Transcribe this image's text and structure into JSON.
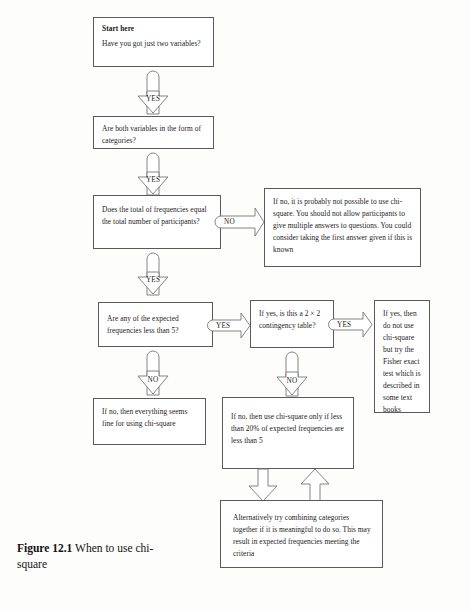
{
  "figure": {
    "label": "Figure 12.1",
    "title": "When to use chi-square"
  },
  "flowchart": {
    "type": "decision-flowchart",
    "nodes": [
      {
        "id": "start",
        "lead": "Start here",
        "text": "Have you got just two variables?"
      },
      {
        "id": "categories",
        "text": "Are both variables in the form of categories?"
      },
      {
        "id": "totals",
        "text": "Does the total of frequencies equal the total number of participants?"
      },
      {
        "id": "not-possible",
        "text": "If no, it is probably not possible to use chi-square. You should not allow participants to give multiple answers to questions. You could consider taking the first answer given if this is known"
      },
      {
        "id": "expected-lt5",
        "text": "Are any of the expected frequencies less than 5?"
      },
      {
        "id": "two-by-two",
        "text": "If yes, is this a 2 × 2 contingency table?"
      },
      {
        "id": "fisher",
        "text": "If yes, then do not use chi-square but try the Fisher exact test which is described in some text books"
      },
      {
        "id": "all-fine",
        "text": "If no, then everything seems fine for using chi-square"
      },
      {
        "id": "twenty-percent",
        "text": "If no, then use chi-square only if less than 20% of expected frequencies are less than 5"
      },
      {
        "id": "combine",
        "text": "Alternatively try combining categories together if it is meaningful to do so. This may result in expected frequencies meeting the criteria"
      }
    ],
    "edges": [
      {
        "id": "start-to-categories",
        "label": "YES",
        "direction": "down"
      },
      {
        "id": "categories-to-totals",
        "label": "YES",
        "direction": "down"
      },
      {
        "id": "totals-to-not-possible",
        "label": "NO",
        "direction": "right"
      },
      {
        "id": "totals-to-expected",
        "label": "YES",
        "direction": "down"
      },
      {
        "id": "expected-to-twobytwo",
        "label": "YES",
        "direction": "right"
      },
      {
        "id": "expected-to-allfine",
        "label": "NO",
        "direction": "down"
      },
      {
        "id": "twobytwo-to-fisher",
        "label": "YES",
        "direction": "right"
      },
      {
        "id": "twobytwo-to-twentypercent",
        "label": "NO",
        "direction": "down"
      },
      {
        "id": "twentypercent-to-combine",
        "label": "",
        "direction": "down"
      },
      {
        "id": "combine-to-twentypercent",
        "label": "",
        "direction": "up"
      }
    ]
  },
  "colors": {
    "stroke": "#5a5a5a",
    "text": "#1b1b1b",
    "background": "#fdfdfc"
  }
}
